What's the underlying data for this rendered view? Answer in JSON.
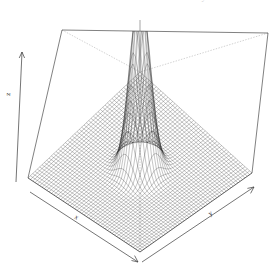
{
  "figure": {
    "kind": "3d-surface-wireframe",
    "background_color": "#ffffff",
    "mesh_color": "#1a1a1a",
    "box_color": "#555555",
    "box_hidden_edge_color": "#aaaaaa",
    "surface_fill_light": "#f2f2f2",
    "surface_fill_dark": "#8a8a8a"
  },
  "top_cropped_text": "Plot of the bivariate normal density",
  "axes": {
    "x_label": "x",
    "y_label": "y",
    "z_label": "z"
  },
  "chart_data": {
    "type": "surface",
    "title": "",
    "subtitle": "",
    "xlabel": "x",
    "ylabel": "y",
    "zlabel": "z",
    "grid": false,
    "legend": "none",
    "projection": "perspective-3d",
    "surface_function": "bivariate-gaussian",
    "xlim": [
      -3,
      3
    ],
    "ylim": [
      -3,
      3
    ],
    "zlim": [
      0,
      1
    ],
    "peak": {
      "x": 0,
      "y": 0,
      "z": 1
    },
    "sigma_x": 0.38,
    "sigma_y": 0.38,
    "grid_n_x": 48,
    "grid_n_y": 48,
    "x": [
      -3,
      -2.75,
      -2.5,
      -2.25,
      -2,
      -1.75,
      -1.5,
      -1.25,
      -1,
      -0.75,
      -0.5,
      -0.25,
      0,
      0.25,
      0.5,
      0.75,
      1,
      1.25,
      1.5,
      1.75,
      2,
      2.25,
      2.5,
      2.75,
      3
    ],
    "y": [
      -3,
      -2.75,
      -2.5,
      -2.25,
      -2,
      -1.75,
      -1.5,
      -1.25,
      -1,
      -0.75,
      -0.5,
      -0.25,
      0,
      0.25,
      0.5,
      0.75,
      1,
      1.25,
      1.5,
      1.75,
      2,
      2.25,
      2.5,
      2.75,
      3
    ],
    "z_profile_along_x_at_y0": [
      0.0,
      0.0,
      0.0,
      0.0,
      0.0,
      0.0,
      0.0,
      0.001,
      0.03,
      0.142,
      0.417,
      0.78,
      1.0,
      0.78,
      0.417,
      0.142,
      0.03,
      0.001,
      0.0,
      0.0,
      0.0,
      0.0,
      0.0,
      0.0,
      0.0
    ],
    "ticks": {
      "x": [],
      "y": [],
      "z": []
    }
  }
}
